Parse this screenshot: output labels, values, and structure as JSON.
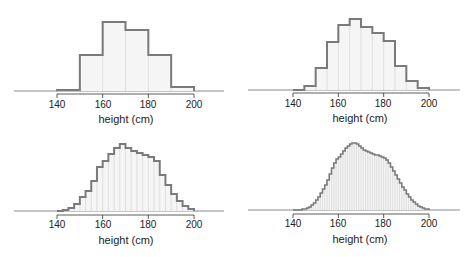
{
  "colors": {
    "outline": "#7a7a7a",
    "fill": "#f5f5f5",
    "bin_separator": "#d8d8d8",
    "baseline": "#8a8a8a",
    "axis": "#333333"
  },
  "chart_data": [
    {
      "type": "bar",
      "title": "",
      "xlabel": "height (cm)",
      "ylabel": "",
      "xlim": [
        130,
        210
      ],
      "xticks": [
        140,
        160,
        180,
        200
      ],
      "bin_width": 10,
      "bin_starts": [
        140,
        150,
        160,
        170,
        180,
        190
      ],
      "values": [
        1,
        36,
        69,
        61,
        36,
        4
      ],
      "grid": false
    },
    {
      "type": "bar",
      "title": "",
      "xlabel": "height (cm)",
      "ylabel": "",
      "xlim": [
        130,
        210
      ],
      "xticks": [
        140,
        160,
        180,
        200
      ],
      "bin_width": 5,
      "bin_starts": [
        140,
        145,
        150,
        155,
        160,
        165,
        170,
        175,
        180,
        185,
        190,
        195
      ],
      "values": [
        0,
        4,
        22,
        48,
        65,
        71,
        63,
        57,
        49,
        24,
        9,
        2
      ],
      "grid": false
    },
    {
      "type": "bar",
      "title": "",
      "xlabel": "height (cm)",
      "ylabel": "",
      "xlim": [
        130,
        210
      ],
      "xticks": [
        140,
        160,
        180,
        200
      ],
      "bin_width": 2.5,
      "bin_starts": [
        140,
        142.5,
        145,
        147.5,
        150,
        152.5,
        155,
        157.5,
        160,
        162.5,
        165,
        167.5,
        170,
        172.5,
        175,
        177.5,
        180,
        182.5,
        185,
        187.5,
        190,
        192.5,
        195,
        197.5
      ],
      "values": [
        0,
        1,
        3,
        7,
        14,
        20,
        30,
        44,
        50,
        57,
        63,
        67,
        63,
        60,
        58,
        56,
        54,
        50,
        36,
        26,
        17,
        10,
        5,
        2
      ],
      "grid": false
    },
    {
      "type": "bar",
      "title": "",
      "xlabel": "height (cm)",
      "ylabel": "",
      "xlim": [
        130,
        210
      ],
      "xticks": [
        140,
        160,
        180,
        200
      ],
      "bin_width": 1,
      "bin_starts": [
        140,
        141,
        142,
        143,
        144,
        145,
        146,
        147,
        148,
        149,
        150,
        151,
        152,
        153,
        154,
        155,
        156,
        157,
        158,
        159,
        160,
        161,
        162,
        163,
        164,
        165,
        166,
        167,
        168,
        169,
        170,
        171,
        172,
        173,
        174,
        175,
        176,
        177,
        178,
        179,
        180,
        181,
        182,
        183,
        184,
        185,
        186,
        187,
        188,
        189,
        190,
        191,
        192,
        193,
        194,
        195,
        196,
        197,
        198,
        199
      ],
      "values": [
        0,
        0,
        0,
        0,
        1,
        1,
        2,
        3,
        5,
        7,
        10,
        13,
        17,
        21,
        25,
        30,
        36,
        42,
        47,
        51,
        53,
        56,
        59,
        62,
        64,
        66,
        67,
        67,
        66,
        64,
        62,
        60,
        59,
        58,
        57,
        56,
        55,
        55,
        54,
        53,
        52,
        50,
        47,
        43,
        39,
        35,
        31,
        27,
        23,
        20,
        16,
        13,
        10,
        8,
        6,
        4,
        3,
        2,
        1,
        1
      ],
      "grid": false
    }
  ],
  "panels": [
    {
      "xlabel": "height (cm)",
      "ticks": [
        "140",
        "160",
        "180",
        "200"
      ]
    },
    {
      "xlabel": "height (cm)",
      "ticks": [
        "140",
        "160",
        "180",
        "200"
      ]
    },
    {
      "xlabel": "height (cm)",
      "ticks": [
        "140",
        "160",
        "180",
        "200"
      ]
    },
    {
      "xlabel": "height (cm)",
      "ticks": [
        "140",
        "160",
        "180",
        "200"
      ]
    }
  ]
}
